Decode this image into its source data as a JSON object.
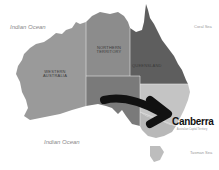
{
  "map": {
    "title": "Australia",
    "highlight_city": "Canberra",
    "highlight_city_subtitle": "Australian Capital Territory",
    "oceans": [
      {
        "label": "Indian Ocean",
        "position": "top-left"
      },
      {
        "label": "Indian Ocean",
        "position": "bottom-center"
      }
    ],
    "seas": [
      {
        "label": "Coral Sea"
      },
      {
        "label": "Tasman Sea"
      }
    ],
    "states": [
      {
        "label": "WESTERN AUSTRALIA",
        "color": "#9a9a9a"
      },
      {
        "label": "NORTHERN TERRITORY",
        "color": "#8c8c8c"
      },
      {
        "label": "QUEENSLAND",
        "color": "#5e5e5e"
      },
      {
        "label": "SOUTH AUSTRALIA",
        "color": "#7a7a7a"
      },
      {
        "label": "NEW SOUTH WALES",
        "color": "#c4c4c4"
      },
      {
        "label": "VICTORIA",
        "color": "#b8b8b8"
      },
      {
        "label": "TASMANIA",
        "color": "#bdbdbd"
      }
    ],
    "arrow": {
      "color": "#111111",
      "direction": "points to Canberra"
    }
  }
}
